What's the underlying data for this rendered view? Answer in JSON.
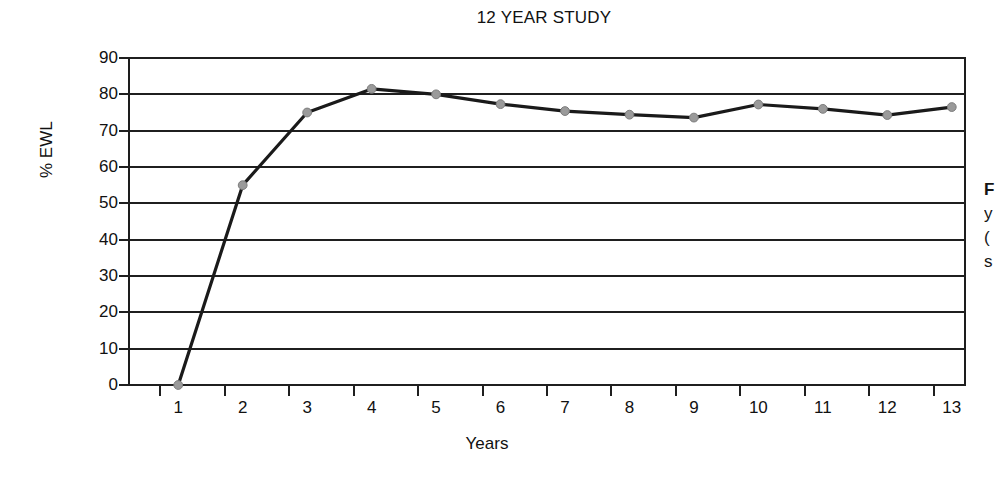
{
  "chart_data": {
    "type": "line",
    "title": "12 YEAR STUDY",
    "xlabel": "Years",
    "ylabel": "% EWL",
    "x": [
      1,
      2,
      3,
      4,
      5,
      6,
      7,
      8,
      9,
      10,
      11,
      12,
      13
    ],
    "categories": [
      "1",
      "2",
      "3",
      "4",
      "5",
      "6",
      "7",
      "8",
      "9",
      "10",
      "11",
      "12",
      "13"
    ],
    "values": [
      0,
      55,
      75,
      81.5,
      80,
      77.3,
      75.4,
      74.4,
      73.6,
      77.2,
      76,
      74.3,
      76.5
    ],
    "series": [
      {
        "name": "% EWL",
        "values": [
          0,
          55,
          75,
          81.5,
          80,
          77.3,
          75.4,
          74.4,
          73.6,
          77.2,
          76,
          74.3,
          76.5
        ]
      }
    ],
    "ylim": [
      0,
      90
    ],
    "xlim": [
      0.5,
      13.5
    ],
    "yticks": [
      0,
      10,
      20,
      30,
      40,
      50,
      60,
      70,
      80,
      90
    ],
    "ytick_labels": [
      "0",
      "10",
      "20",
      "30",
      "40",
      "50",
      "60",
      "70",
      "80",
      "90"
    ],
    "xtick_labels": [
      "1",
      "2",
      "3",
      "4",
      "5",
      "6",
      "7",
      "8",
      "9",
      "10",
      "11",
      "12",
      "13"
    ],
    "grid": "horizontal",
    "legend": "none",
    "line_color": "#1a1a1a",
    "marker_color": "#9a9a9a",
    "marker_edge_color": "#7d7d7d",
    "background_color": "#ffffff",
    "axis_color": "#1f1f1f"
  },
  "side_caption": {
    "line1": "F",
    "line2": "y",
    "line3": "(",
    "line4": "s"
  }
}
